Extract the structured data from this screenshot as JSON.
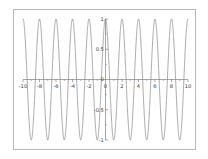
{
  "figure": {
    "background_color": "#ffffff",
    "frame_color": "#b9b9b9",
    "axis_color": "#6b6b6b",
    "curve_color": "#707070",
    "tick_label_color": "#3a3a3a"
  },
  "chart_data": {
    "type": "line",
    "title": "",
    "subtitle": "",
    "xlabel": "",
    "ylabel": "",
    "xlim": [
      -10,
      10
    ],
    "ylim": [
      -1,
      1
    ],
    "grid": false,
    "legend": null,
    "annotations": [],
    "x_ticks": [
      -10,
      -8,
      -6,
      -4,
      -2,
      0,
      2,
      4,
      6,
      8,
      10
    ],
    "x_tick_labels": [
      "-10",
      "-8",
      "-6",
      "-4",
      "-2",
      "0",
      "2",
      "4",
      "6",
      "8",
      "10"
    ],
    "x_minor_ticks": [
      -9,
      -7,
      -5,
      -3,
      -1,
      1,
      3,
      5,
      7,
      9
    ],
    "y_ticks": [
      -1,
      -0.5,
      0,
      0.5,
      1
    ],
    "y_tick_labels": [
      "-1",
      "-0.5",
      "0",
      "0.5",
      "1"
    ],
    "y_minor_ticks": [
      -0.75,
      -0.25,
      0.25,
      0.75
    ],
    "series": [
      {
        "name": "cos(pi x)",
        "expression": "cos(pi*x)",
        "amplitude": 1,
        "period": 2,
        "phase": 0,
        "color": "#707070",
        "linewidth": 0.6,
        "x": [
          -10,
          -9.5,
          -9,
          -8.5,
          -8,
          -7.5,
          -7,
          -6.5,
          -6,
          -5.5,
          -5,
          -4.5,
          -4,
          -3.5,
          -3,
          -2.5,
          -2,
          -1.5,
          -1,
          -0.5,
          0,
          0.5,
          1,
          1.5,
          2,
          2.5,
          3,
          3.5,
          4,
          4.5,
          5,
          5.5,
          6,
          6.5,
          7,
          7.5,
          8,
          8.5,
          9,
          9.5,
          10
        ],
        "values": [
          1,
          0,
          -1,
          0,
          1,
          0,
          -1,
          0,
          1,
          0,
          -1,
          0,
          1,
          0,
          -1,
          0,
          1,
          0,
          -1,
          0,
          1,
          0,
          -1,
          0,
          1,
          0,
          -1,
          0,
          1,
          0,
          -1,
          0,
          1,
          0,
          -1,
          0,
          1,
          0,
          -1,
          0,
          1
        ]
      }
    ]
  }
}
